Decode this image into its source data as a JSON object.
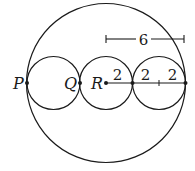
{
  "diagram": {
    "points": [
      {
        "id": "P",
        "label": "P"
      },
      {
        "id": "Q",
        "label": "Q"
      },
      {
        "id": "R",
        "label": "R"
      }
    ],
    "segment_labels": [
      "2",
      "2",
      "2"
    ],
    "dimension_label": "6",
    "colors": {
      "stroke": "#1a1a1a",
      "background": "#ffffff"
    }
  }
}
